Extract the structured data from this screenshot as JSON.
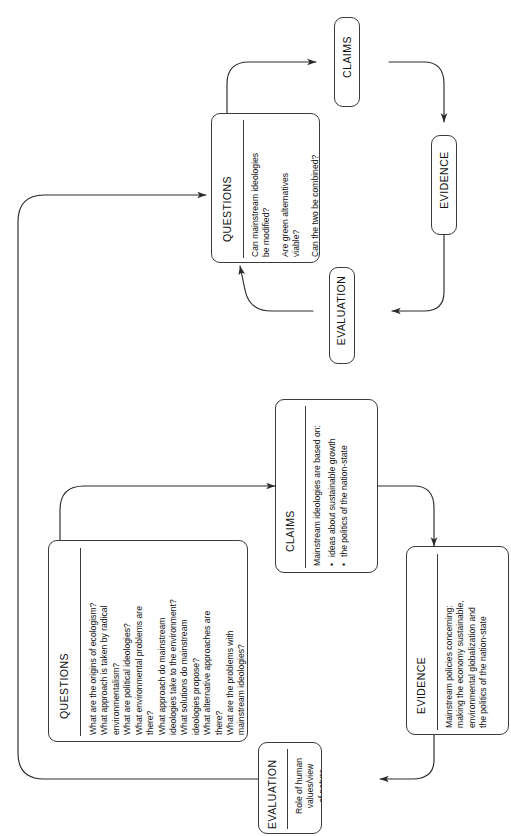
{
  "diagram": {
    "orientation": "rotated-90",
    "stroke_color": "#3a3a3a",
    "text_color": "#111111",
    "background": "#ffffff"
  },
  "cycles": [
    {
      "name": "upper-cycle",
      "nodes": [
        "questions_top",
        "claims_top",
        "evidence_top",
        "evaluation_top"
      ]
    },
    {
      "name": "lower-cycle",
      "nodes": [
        "questions_bottom",
        "claims_bottom",
        "evidence_bottom",
        "evaluation_bottom"
      ]
    }
  ],
  "nodes": {
    "questions_top": {
      "label": "QUESTIONS",
      "lines": [
        "Can mainstream ideologies\nbe modified?",
        "Are green alternatives\nviable?",
        "Can the two be combined?"
      ]
    },
    "claims_top": {
      "label": "CLAIMS"
    },
    "evidence_top": {
      "label": "EVIDENCE"
    },
    "evaluation_top": {
      "label": "EVALUATION"
    },
    "questions_bottom": {
      "label": "QUESTIONS",
      "lines": [
        "What are the origins of ecologism?\nWhat approach is taken by radical\nenvironmentalism?\nWhat are political ideologies?\nWhat environmental problems are\nthere?\nWhat approach do mainstream\nideologies take to the environment?\nWhat solutions do mainstream\nideologies propose?\nWhat alternative approaches are\nthere?\nWhat are the problems with\nmainstream ideologies?"
      ]
    },
    "claims_bottom": {
      "label": "CLAIMS",
      "intro": "Mainstream ideologies are based on:",
      "bullets": [
        "ideas about sustainable growth",
        "the politics of the nation-state"
      ]
    },
    "evidence_bottom": {
      "label": "EVIDENCE",
      "lines": [
        "Mainstream policies concerning:\nmaking the economy sustainable,\nenvironmental globalization and\nthe politics of the nation-state"
      ]
    },
    "evaluation_bottom": {
      "label": "EVALUATION",
      "lines": [
        "Role of human\nvalues/view\nof nature"
      ]
    }
  },
  "connectors": [
    {
      "from": "questions_top",
      "to": "claims_top",
      "type": "curved-arrow"
    },
    {
      "from": "claims_top",
      "to": "evidence_top",
      "type": "curved-arrow"
    },
    {
      "from": "evidence_top",
      "to": "evaluation_top",
      "type": "curved-arrow"
    },
    {
      "from": "evaluation_top",
      "to": "questions_top",
      "type": "curved-arrow"
    },
    {
      "from": "questions_bottom",
      "to": "claims_bottom",
      "type": "curved-arrow"
    },
    {
      "from": "claims_bottom",
      "to": "evidence_bottom",
      "type": "curved-arrow"
    },
    {
      "from": "evidence_bottom",
      "to": "evaluation_bottom",
      "type": "curved-arrow"
    },
    {
      "from": "evaluation_bottom",
      "to": "questions_top",
      "type": "long-wrap-arrow"
    }
  ]
}
